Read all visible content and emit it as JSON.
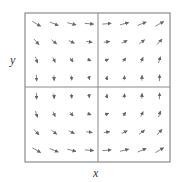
{
  "figure": {
    "type": "vector-field",
    "x_label": "x",
    "y_label": "y",
    "colors": {
      "frame": "#888888",
      "arrow": "#777777",
      "label": "#333333"
    }
  },
  "chart_data": {
    "type": "vector-field",
    "title": "",
    "xlabel": "x",
    "ylabel": "y",
    "grid": false,
    "xlim": [
      -2,
      2
    ],
    "ylim": [
      -2,
      2
    ],
    "field_description": "F(x, y) ≈ (y², x): arrows point right everywhere with length growing in |y|; vertical component points up for x>0 and down for x<0",
    "grid_points_per_axis": 8,
    "axes_lines": {
      "vertical_at_x": 0,
      "horizontal_at_y": 0
    }
  }
}
